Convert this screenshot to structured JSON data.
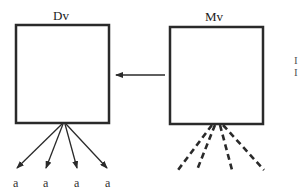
{
  "diagram": {
    "boxes": [
      {
        "id": "dv",
        "label": "Dv",
        "x": 16,
        "y": 25,
        "w": 93,
        "h": 98
      },
      {
        "id": "mv",
        "label": "Mv",
        "x": 170,
        "y": 27,
        "w": 93,
        "h": 97
      }
    ],
    "arrow": {
      "from": "mv",
      "to": "dv",
      "x1": 165,
      "y1": 75,
      "x2": 116,
      "y2": 75
    },
    "solid_outputs": {
      "origin": [
        62,
        124
      ],
      "targets": [
        [
          17,
          168
        ],
        [
          46,
          168
        ],
        [
          77,
          168
        ],
        [
          107,
          168
        ]
      ],
      "labels": [
        "a",
        "a",
        "a",
        "a"
      ]
    },
    "dashed_outputs": {
      "origin": [
        218,
        124
      ],
      "targets": [
        [
          178,
          170
        ],
        [
          197,
          170
        ],
        [
          232,
          170
        ],
        [
          264,
          170
        ]
      ]
    },
    "edge_marks": [
      "I",
      "I"
    ],
    "colors": {
      "stroke": "#2a2a2a",
      "background": "#ffffff"
    }
  }
}
